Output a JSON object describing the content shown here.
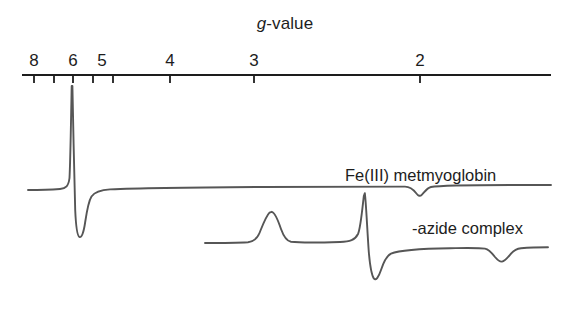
{
  "figure": {
    "type": "epr-derivative-spectrum",
    "background_color": "#ffffff",
    "line_color": "#4a4a4a",
    "axis_color": "#1d1d1d",
    "axis_title_prefix": "g",
    "axis_title_suffix": "-value",
    "axis_title_full": "g-value"
  },
  "axis": {
    "name": "g-value axis",
    "orientation": "horizontal",
    "line_y": 75,
    "line_x_start": 22,
    "line_x_end": 551,
    "labeled_ticks": [
      {
        "label": "8",
        "g": 8,
        "x": 34
      },
      {
        "label": "6",
        "g": 6,
        "x": 73
      },
      {
        "label": "5",
        "g": 5,
        "x": 102
      },
      {
        "label": "4",
        "g": 4,
        "x": 170
      },
      {
        "label": "3",
        "g": 3,
        "x": 254
      },
      {
        "label": "2",
        "g": 2,
        "x": 420
      }
    ],
    "unlabeled_ticks": [
      {
        "g": 7,
        "x": 54
      },
      {
        "g": 5.5,
        "x": 93
      },
      {
        "g": 4.5,
        "x": 132
      }
    ]
  },
  "traces": [
    {
      "id": "upper",
      "label": "Fe(III) metmyoglobin",
      "baseline_y": 189,
      "x_start": 28,
      "x_end": 551,
      "features": [
        {
          "kind": "derivative-peak",
          "g": 6.0,
          "x": 73,
          "peak_y": 86,
          "trough_y": 237,
          "width": 20,
          "description": "intense g = 6 high-spin derivative signal"
        },
        {
          "kind": "shallow-dip",
          "g": 2.0,
          "x": 421,
          "depth_y": 196,
          "width": 26,
          "description": "weak g = 2 feature"
        }
      ]
    },
    {
      "id": "lower",
      "label": "-azide complex",
      "baseline_y": 242,
      "x_start": 205,
      "x_end": 548,
      "features": [
        {
          "kind": "broad-peak",
          "g": 2.8,
          "x": 272,
          "peak_y": 212,
          "width": 38,
          "description": "low-spin g-z feature"
        },
        {
          "kind": "derivative-peak",
          "g": 2.2,
          "x": 365,
          "peak_y": 193,
          "trough_y": 279,
          "width": 16,
          "description": "sharp low-spin derivative feature"
        },
        {
          "kind": "shallow-dip",
          "g": 1.75,
          "x": 501,
          "depth_y": 259,
          "width": 34,
          "description": "broad g-x feature"
        }
      ]
    }
  ]
}
